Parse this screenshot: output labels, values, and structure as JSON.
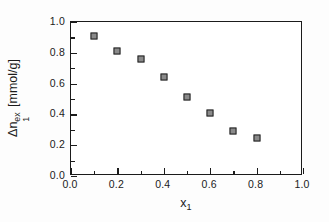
{
  "chart_data": {
    "type": "scatter",
    "title": "",
    "xlabel": "x_1",
    "ylabel": "Δn_1^ex [mmol/g]",
    "xlabel_parts": {
      "base": "x",
      "sub": "1"
    },
    "ylabel_parts": {
      "delta": "Δ",
      "base": "n",
      "sub": "1",
      "sup": "ex",
      "units": "[mmol/g]"
    },
    "xlim": [
      0.0,
      1.0
    ],
    "ylim": [
      0.0,
      1.0
    ],
    "grid": false,
    "legend": "none",
    "marker": "open-square",
    "marker_face_color": "#8a8a8a",
    "marker_edge_color": "#202020",
    "x": [
      0.1,
      0.2,
      0.3,
      0.4,
      0.5,
      0.6,
      0.7,
      0.8
    ],
    "values": [
      0.91,
      0.81,
      0.76,
      0.645,
      0.515,
      0.41,
      0.295,
      0.245
    ],
    "xticks": [
      0.0,
      0.2,
      0.4,
      0.6,
      0.8,
      1.0
    ],
    "xticklabels": [
      "0.0",
      "0.2",
      "0.4",
      "0.6",
      "0.8",
      "1.0"
    ],
    "xminorticks": [
      0.1,
      0.3,
      0.5,
      0.7,
      0.9
    ],
    "yticks": [
      0.0,
      0.2,
      0.4,
      0.6,
      0.8,
      1.0
    ],
    "yticklabels": [
      "0.0",
      "0.2",
      "0.4",
      "0.6",
      "0.8",
      "1.0"
    ],
    "yminorticks": [
      0.1,
      0.3,
      0.5,
      0.7,
      0.9
    ],
    "colors": {
      "axis": "#1b1b1b",
      "text": "#1b1b1b",
      "plot_background": "#ffffff",
      "figure_background": "#fdfdfd"
    }
  }
}
